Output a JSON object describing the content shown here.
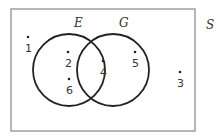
{
  "diagram": {
    "type": "venn",
    "universe_label": "S",
    "sets": [
      {
        "label": "E",
        "elements": [
          "2",
          "4",
          "6"
        ]
      },
      {
        "label": "G",
        "elements": [
          "4",
          "5"
        ]
      }
    ],
    "elements": {
      "only_E": [
        "2",
        "6"
      ],
      "E_and_G": [
        "4"
      ],
      "only_G": [
        "5"
      ],
      "outside": [
        "1",
        "3"
      ]
    },
    "points": [
      {
        "label": "1"
      },
      {
        "label": "2"
      },
      {
        "label": "6"
      },
      {
        "label": "4"
      },
      {
        "label": "5"
      },
      {
        "label": "3"
      }
    ],
    "colors": {
      "stroke": "#222222",
      "border": "#888888",
      "background": "#ffffff"
    }
  }
}
